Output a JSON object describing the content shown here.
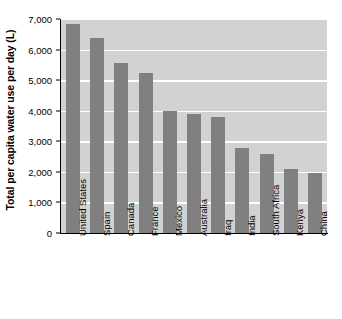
{
  "chart_data": {
    "type": "bar",
    "title": "",
    "subtitle": "",
    "xlabel": "",
    "ylabel": "Total per capita water use per day (L)",
    "categories": [
      "United States",
      "Spain",
      "Canada",
      "France",
      "Mexico",
      "Australia",
      "Iraq",
      "India",
      "South Africa",
      "Kenya",
      "China"
    ],
    "values": [
      6850,
      6370,
      5560,
      5230,
      4000,
      3900,
      3780,
      2780,
      2600,
      2080,
      1950
    ],
    "ylim": [
      0,
      7000
    ],
    "ytick_labels": [
      "0",
      "1,000",
      "2,000",
      "3,000",
      "4,000",
      "5,000",
      "6,000",
      "7,000"
    ],
    "ytick_values": [
      0,
      1000,
      2000,
      3000,
      4000,
      5000,
      6000,
      7000
    ],
    "grid": true,
    "legend": "none",
    "colors": {
      "bar": "#808080",
      "plot_background": "#d2d2d2",
      "gridline": "#ffffff",
      "axis": "#000000",
      "text": "#000000",
      "figure_background": "#ffffff"
    }
  }
}
